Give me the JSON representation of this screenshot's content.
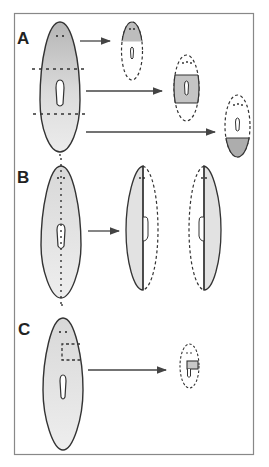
{
  "figure": {
    "panels": [
      {
        "label": "A",
        "description": "Planarian cut transversely into head, trunk and tail fragments; each regenerates missing parts"
      },
      {
        "label": "B",
        "description": "Planarian cut longitudinally along midline; each half regenerates the missing side"
      },
      {
        "label": "C",
        "description": "Small piece excised from head region regenerates a complete small worm"
      }
    ],
    "colors": {
      "frame": "#888888",
      "outline": "#333333",
      "shade_dark": "#b9b9b9",
      "shade_light": "#e6e6e6",
      "background": "#ffffff"
    }
  }
}
